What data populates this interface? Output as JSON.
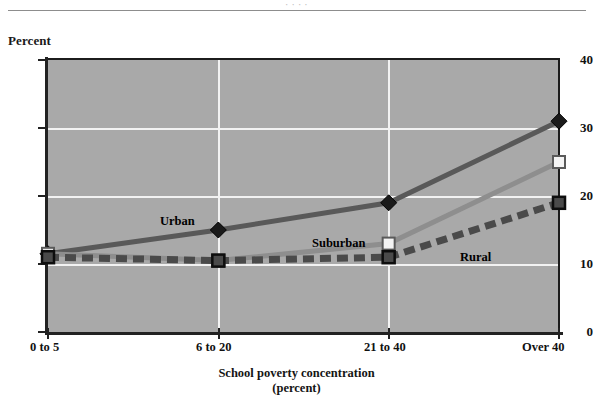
{
  "figure": {
    "top_cropped_text": "· · · ·",
    "y_axis_title": "Percent",
    "x_axis_title_line1": "School poverty concentration",
    "x_axis_title_line2": "(percent)"
  },
  "series_labels": {
    "urban": "Urban",
    "suburban": "Suburban",
    "rural": "Rural"
  },
  "colors": {
    "plot_background": "#a9a9a9",
    "gridline": "#f2f2f2",
    "axis": "#222222",
    "urban": "#595959",
    "suburban": "#8e8e8e",
    "rural": "#4a4a4a",
    "text": "#111111"
  },
  "chart_data": {
    "type": "line",
    "title": "",
    "xlabel": "School poverty concentration (percent)",
    "ylabel": "Percent",
    "categories": [
      "0 to 5",
      "6 to 20",
      "21 to 40",
      "Over 40"
    ],
    "ylim": [
      0,
      40
    ],
    "yticks": [
      0,
      10,
      20,
      30,
      40
    ],
    "grid": true,
    "legend": "inline-labels",
    "series": [
      {
        "name": "Urban",
        "values": [
          11.5,
          15,
          19,
          31
        ],
        "marker": "diamond",
        "linestyle": "solid",
        "color": "#595959"
      },
      {
        "name": "Suburban",
        "values": [
          11.5,
          10.5,
          13,
          25
        ],
        "marker": "open-square",
        "linestyle": "solid",
        "color": "#8e8e8e"
      },
      {
        "name": "Rural",
        "values": [
          11,
          10.5,
          11,
          19
        ],
        "marker": "filled-square",
        "linestyle": "dashed",
        "color": "#4a4a4a"
      }
    ]
  }
}
